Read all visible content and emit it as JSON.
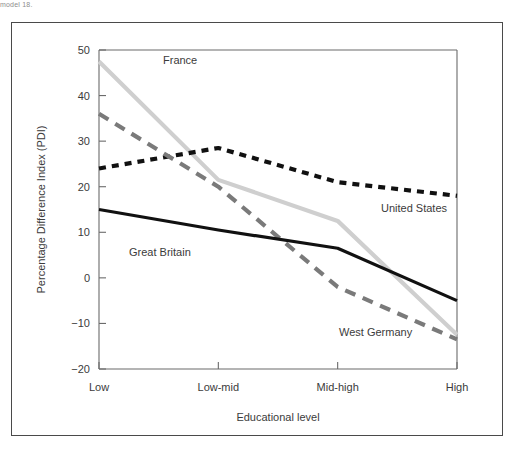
{
  "page": {
    "caption_fragment": "model 18.",
    "background_color": "#ffffff",
    "frame_color": "#4a4a4a"
  },
  "chart_data": {
    "type": "line",
    "title": "",
    "xlabel": "Educational level",
    "ylabel": "Percentage Difference Index (PDI)",
    "categories": [
      "Low",
      "Low-mid",
      "Mid-high",
      "High"
    ],
    "ylim": [
      -20,
      50
    ],
    "yticks": [
      -20,
      -10,
      0,
      10,
      20,
      30,
      40,
      50
    ],
    "ytick_labels": [
      "−20",
      "−10",
      "0",
      "10",
      "20",
      "30",
      "40",
      "50"
    ],
    "grid": false,
    "legend": "inline-annotations",
    "series": [
      {
        "name": "France",
        "values": [
          47.5,
          21.5,
          12.5,
          -12.5
        ],
        "color": "#cfcfcf",
        "style": "solid",
        "width": 4.2,
        "label_x": 152,
        "label_y": 42,
        "label_anchor": "start"
      },
      {
        "name": "United States",
        "values": [
          24.0,
          28.5,
          21.0,
          18.0
        ],
        "color": "#111111",
        "style": "dotted",
        "width": 4.2,
        "label_x": 370,
        "label_y": 190,
        "label_anchor": "start"
      },
      {
        "name": "West Germany",
        "values": [
          36.0,
          20.0,
          -2.0,
          -13.5
        ],
        "color": "#7a7a7a",
        "style": "dashed",
        "width": 4.2,
        "label_x": 328,
        "label_y": 314,
        "label_anchor": "start"
      },
      {
        "name": "Great Britain",
        "values": [
          15.0,
          10.5,
          6.5,
          -5.0
        ],
        "color": "#111111",
        "style": "solid",
        "width": 3.2,
        "label_x": 118,
        "label_y": 234,
        "label_anchor": "start"
      }
    ]
  }
}
